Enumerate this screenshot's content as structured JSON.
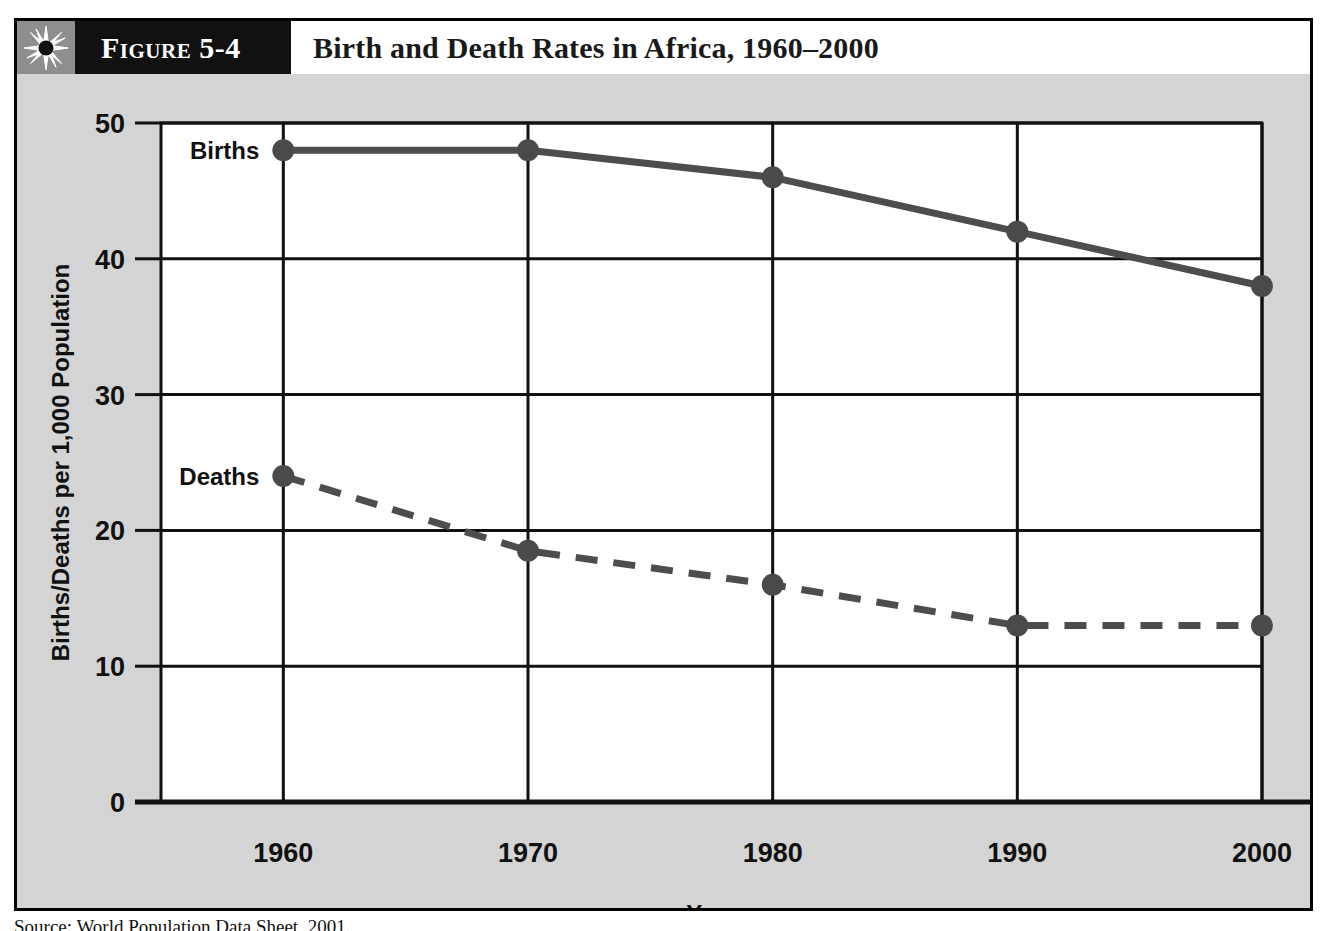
{
  "figure": {
    "number_label": "Figure 5-4",
    "title": "Birth and Death Rates in Africa, 1960–2000",
    "icon": "sunburst-icon",
    "source_caption": "Source: World Population Data Sheet, 2001."
  },
  "colors": {
    "frame_border": "#000000",
    "header_band": "#111111",
    "icon_box": "#8e8e8e",
    "title_band": "#ffffff",
    "chart_background": "#d4d4d4",
    "plot_background": "#ffffff",
    "gridline": "#111111",
    "births_line": "#4d4d4d",
    "deaths_line": "#4d4d4d",
    "marker": "#4a4a4a"
  },
  "chart_data": {
    "type": "line",
    "title": "Birth and Death Rates in Africa, 1960–2000",
    "xlabel": "Year",
    "ylabel": "Births/Deaths per 1,000 Population",
    "categories": [
      "1960",
      "1970",
      "1980",
      "1990",
      "2000"
    ],
    "x": [
      1960,
      1970,
      1980,
      1990,
      2000
    ],
    "xlim": [
      1955,
      2000
    ],
    "ylim": [
      0,
      50
    ],
    "yticks": [
      0,
      10,
      20,
      30,
      40,
      50
    ],
    "xticks": [
      "1960",
      "1970",
      "1980",
      "1990",
      "2000"
    ],
    "grid": true,
    "legend_position": "inline-labels",
    "series": [
      {
        "name": "Births",
        "label": "Births",
        "style": "solid",
        "values": [
          48,
          48,
          46,
          42,
          38
        ]
      },
      {
        "name": "Deaths",
        "label": "Deaths",
        "style": "dashed",
        "values": [
          24,
          18.5,
          16,
          13,
          13
        ]
      }
    ]
  }
}
